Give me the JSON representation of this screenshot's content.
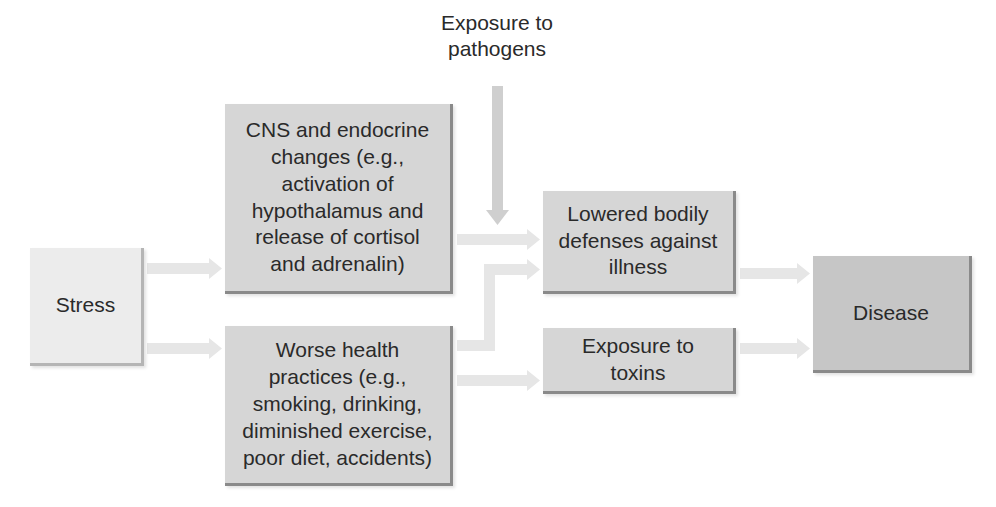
{
  "diagram": {
    "nodes": {
      "stress": "Stress",
      "cns": "CNS and endocrine changes (e.g., activation of hypothalamus and release of cortisol and adrenalin)",
      "worse_health": "Worse health practices (e.g., smoking, drinking, diminished exercise, poor diet, accidents)",
      "lowered_defenses": "Lowered bodily defenses against illness",
      "exposure_toxins": "Exposure to toxins",
      "disease": "Disease",
      "exposure_pathogens": "Exposure to pathogens"
    },
    "lines": {
      "cns": [
        "CNS and endocrine",
        "changes (e.g.,",
        "activation of",
        "hypothalamus and",
        "release of cortisol",
        "and adrenalin)"
      ],
      "worse_health": [
        "Worse health",
        "practices (e.g.,",
        "smoking, drinking,",
        "diminished exercise,",
        "poor diet, accidents)"
      ],
      "lowered_defenses": [
        "Lowered bodily",
        "defenses against",
        "illness"
      ],
      "exposure_toxins": [
        "Exposure to",
        "toxins"
      ],
      "exposure_pathogens": [
        "Exposure to",
        "pathogens"
      ]
    },
    "edges": [
      {
        "from": "stress",
        "to": "cns"
      },
      {
        "from": "stress",
        "to": "worse_health"
      },
      {
        "from": "cns",
        "to": "lowered_defenses"
      },
      {
        "from": "exposure_pathogens",
        "to": "lowered_defenses"
      },
      {
        "from": "worse_health",
        "to": "lowered_defenses"
      },
      {
        "from": "worse_health",
        "to": "exposure_toxins"
      },
      {
        "from": "lowered_defenses",
        "to": "disease"
      },
      {
        "from": "exposure_toxins",
        "to": "disease"
      }
    ],
    "colors": {
      "arrow": "#e6e6e6",
      "arrow_vertical": "#cfcfcf",
      "stress_fill": "#ececec",
      "box_fill": "#d6d6d6",
      "disease_fill": "#c6c6c6"
    }
  }
}
